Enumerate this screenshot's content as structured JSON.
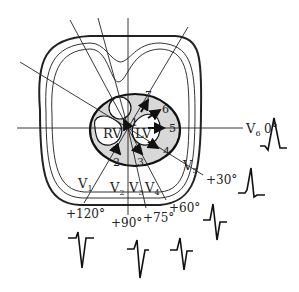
{
  "diagram": {
    "chambers": {
      "right_ventricle": "RV",
      "left_ventricle": "LV"
    },
    "vector_points": [
      "1",
      "2",
      "3",
      "4",
      "5",
      "6",
      "7"
    ],
    "leads": [
      {
        "name": "V",
        "sub": "1",
        "angle": "+120°",
        "waveform": "rS"
      },
      {
        "name": "V",
        "sub": "2",
        "angle": "+90°",
        "waveform": "rS"
      },
      {
        "name": "V",
        "sub": "3",
        "angle": "+75°",
        "waveform": "RS"
      },
      {
        "name": "V",
        "sub": "4",
        "angle": "+60°",
        "waveform": "Rs"
      },
      {
        "name": "V",
        "sub": "5",
        "angle": "+30°",
        "waveform": "qRs"
      },
      {
        "name": "V",
        "sub": "6",
        "angle": "0°",
        "waveform": "qR"
      }
    ],
    "colors": {
      "ink": "#222222",
      "heart_fill": "#d8d8d8",
      "background": "#ffffff"
    }
  }
}
